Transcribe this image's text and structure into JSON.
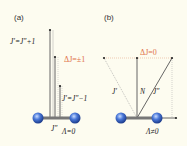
{
  "panels": [
    {
      "id": "a",
      "label": "(a)",
      "upper_branch_label": "J′=J″+1",
      "lower_branch_label": "J′=J″−1",
      "selection_rule": "ΔJ=±1",
      "bottom_label": "J″",
      "lambda_label": "Λ=0"
    },
    {
      "id": "b",
      "label": "(b)",
      "selection_rule": "ΔJ=0",
      "left_vector_label": "J′",
      "center_vector_label": "N",
      "right_vector_label": "J″",
      "lambda_label": "Λ≠0"
    }
  ],
  "colors": {
    "background": "#fdfcf0",
    "accent": "#e0724a",
    "atom": "#2a52b8",
    "line": "#555555",
    "dotted": "#999999"
  }
}
